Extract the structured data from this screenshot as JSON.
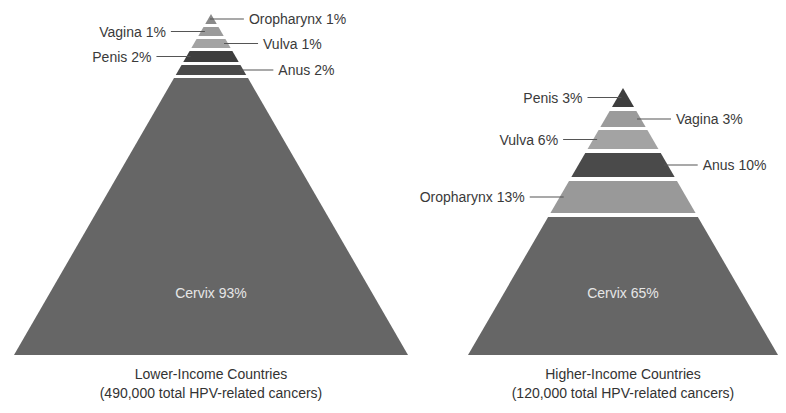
{
  "chart_data": [
    {
      "type": "pyramid",
      "title": "Lower-Income Countries",
      "subtitle": "(490,000 total HPV-related cancers)",
      "total_cancers": 490000,
      "categories": [
        "Oropharynx",
        "Vagina",
        "Vulva",
        "Penis",
        "Anus",
        "Cervix"
      ],
      "values": [
        1,
        1,
        1,
        2,
        2,
        93
      ],
      "unit": "%",
      "colors": [
        "#8a8a8a",
        "#9b9b9b",
        "#a3a3a3",
        "#3e3e3e",
        "#4a4a4a",
        "#666666"
      ],
      "label_side": [
        "right",
        "left",
        "right",
        "left",
        "right",
        "inside"
      ],
      "labels": [
        "Oropharynx 1%",
        "Vagina 1%",
        "Vulva 1%",
        "Penis 2%",
        "Anus 2%",
        "Cervix 93%"
      ]
    },
    {
      "type": "pyramid",
      "title": "Higher-Income Countries",
      "subtitle": "(120,000 total HPV-related cancers)",
      "total_cancers": 120000,
      "categories": [
        "Penis",
        "Vagina",
        "Vulva",
        "Anus",
        "Oropharynx",
        "Cervix"
      ],
      "values": [
        3,
        3,
        6,
        10,
        13,
        65
      ],
      "unit": "%",
      "colors": [
        "#3e3e3e",
        "#9b9b9b",
        "#a3a3a3",
        "#4a4a4a",
        "#999999",
        "#666666"
      ],
      "label_side": [
        "left",
        "right",
        "left",
        "right",
        "left",
        "inside"
      ],
      "labels": [
        "Penis 3%",
        "Vagina 3%",
        "Vulva 6%",
        "Anus 10%",
        "Oropharynx 13%",
        "Cervix 65%"
      ]
    }
  ],
  "layout": {
    "pyramids": [
      {
        "apex": [
          211,
          14
        ],
        "base_y": 355,
        "base_half": 197,
        "bands": [
          [
            14,
            24
          ],
          [
            27,
            36
          ],
          [
            39,
            48
          ],
          [
            51,
            62
          ],
          [
            65,
            75
          ],
          [
            78,
            355
          ]
        ],
        "inner_label_y": 298,
        "caption_y": [
          379,
          398
        ]
      },
      {
        "apex": [
          623,
          88
        ],
        "base_y": 355,
        "base_half": 155,
        "bands": [
          [
            88,
            107
          ],
          [
            111,
            127
          ],
          [
            130,
            149
          ],
          [
            153,
            177
          ],
          [
            181,
            213
          ],
          [
            217,
            355
          ]
        ],
        "inner_label_y": 298,
        "caption_y": [
          379,
          398
        ]
      }
    ]
  }
}
